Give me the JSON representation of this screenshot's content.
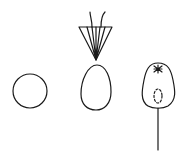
{
  "figure": {
    "background": "#ffffff",
    "stroke_color": "#1a1a1a",
    "items": [
      {
        "name": "round-shape",
        "description": "plain circle"
      },
      {
        "name": "egg-shape-with-pappus",
        "description": "egg-shaped outline with cone of bristles and two hairs above"
      },
      {
        "name": "pear-shape-with-stalk",
        "description": "pear-shaped outline with star at apex, dashed inner oval, and long stalk"
      }
    ]
  }
}
